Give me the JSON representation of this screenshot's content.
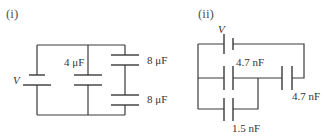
{
  "diagram": {
    "type": "capacitor-circuits",
    "colors": {
      "line": "#3a3a3a",
      "text": "#333333",
      "background": "#ffffff"
    },
    "circuits": [
      {
        "part_label": "(i)",
        "source_label": "V",
        "capacitors": [
          {
            "label": "4 μF",
            "position": "middle-branch"
          },
          {
            "label": "8 μF",
            "position": "right-branch-top"
          },
          {
            "label": "8 μF",
            "position": "right-branch-bottom"
          }
        ]
      },
      {
        "part_label": "(ii)",
        "source_label": "V",
        "capacitors": [
          {
            "label": "4.7 nF",
            "position": "middle-left"
          },
          {
            "label": "4.7 nF",
            "position": "right"
          },
          {
            "label": "1.5 nF",
            "position": "bottom"
          }
        ]
      }
    ]
  }
}
